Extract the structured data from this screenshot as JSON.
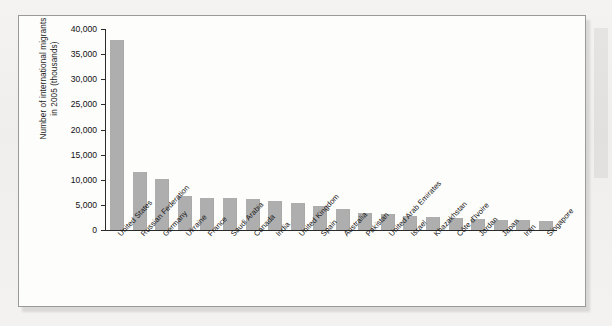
{
  "figure": {
    "y_axis_title_line1": "Number of international migrants",
    "y_axis_title_line2": "in 2005 (thousands)",
    "bar_color": "#aeaeae",
    "frame_color": "#9a9a98",
    "plot_background": "#fdfdfc"
  },
  "chart_data": {
    "type": "bar",
    "title": "",
    "xlabel": "",
    "ylabel": "Number of international migrants in 2005 (thousands)",
    "ylim": [
      0,
      40000
    ],
    "ytick_step": 5000,
    "grid": false,
    "legend": null,
    "ytick_labels": [
      "0",
      "5,000",
      "10,000",
      "15,000",
      "20,000",
      "25,000",
      "30,000",
      "35,000",
      "40,000"
    ],
    "ytick_values": [
      0,
      5000,
      10000,
      15000,
      20000,
      25000,
      30000,
      35000,
      40000
    ],
    "categories": [
      "United States",
      "Russian Federation",
      "Germany",
      "Ukraine",
      "France",
      "Saudi Arabia",
      "Canada",
      "India",
      "United Kingdom",
      "Spain",
      "Australia",
      "Pakistan",
      "United Arab Emirates",
      "Israel",
      "Khazakhstan",
      "Côte d'Ivoire",
      "Jordan",
      "Japan",
      "Iran",
      "Singapore"
    ],
    "values": [
      37900,
      11600,
      10100,
      6800,
      6400,
      6300,
      6100,
      5700,
      5400,
      4800,
      4100,
      3300,
      3200,
      2700,
      2500,
      2400,
      2200,
      2000,
      1900,
      1800
    ]
  }
}
